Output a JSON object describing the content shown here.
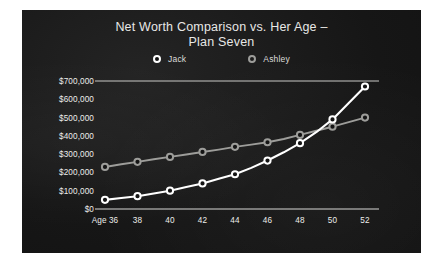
{
  "chart_data": {
    "type": "line",
    "title": "Net Worth Comparison vs.  Her Age – Plan Seven",
    "title_line1": "Net Worth Comparison vs.  Her Age –",
    "title_line2": "Plan Seven",
    "xlabel": "",
    "ylabel": "",
    "x_first_label": "Age 36",
    "x": [
      36,
      37,
      38,
      39,
      40,
      41,
      42,
      43,
      44,
      45,
      46,
      47,
      48,
      49,
      50,
      51,
      52
    ],
    "tick_x": [
      36,
      38,
      40,
      42,
      44,
      46,
      48,
      50,
      52
    ],
    "tick_x_labels": [
      "Age 36",
      "38",
      "40",
      "42",
      "44",
      "46",
      "48",
      "50",
      "52"
    ],
    "ylim": [
      0,
      700000
    ],
    "y_ticks": [
      700000,
      600000,
      500000,
      400000,
      300000,
      200000,
      100000,
      0
    ],
    "y_tick_labels": [
      "$700,000",
      "$600,000",
      "$500,000",
      "$400,000",
      "$300,000",
      "$200,000",
      "$100,000",
      "$0"
    ],
    "grid": false,
    "legend_position": "top-center",
    "series": [
      {
        "name": "Jack",
        "color": "#ffffff",
        "marker": "circle-open-white",
        "values": [
          50000,
          60000,
          70000,
          85000,
          100000,
          120000,
          140000,
          165000,
          190000,
          225000,
          265000,
          310000,
          360000,
          420000,
          490000,
          580000,
          670000
        ]
      },
      {
        "name": "Ashley",
        "color": "#9d9d9a",
        "marker": "circle-open-gray",
        "values": [
          230000,
          245000,
          258000,
          272000,
          285000,
          298000,
          312000,
          325000,
          340000,
          352000,
          365000,
          383000,
          405000,
          428000,
          450000,
          475000,
          500000
        ]
      }
    ]
  }
}
